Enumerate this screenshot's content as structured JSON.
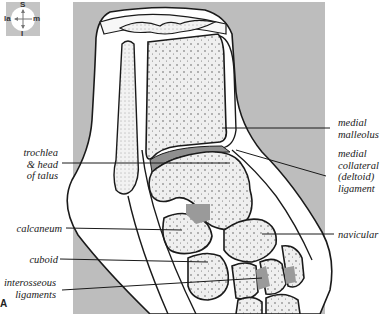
{
  "figure": {
    "figure_mark": "A",
    "colors": {
      "background_panel": "#bdbdbd",
      "bone": "#eeeeee",
      "soft_tissue": "#ffffff",
      "ligament_shading": "#9a9a9a",
      "outline": "#1a1a1a"
    }
  },
  "orientation": {
    "superior": "S",
    "inferior": "I",
    "lateral": "la",
    "medial": "m"
  },
  "labels": {
    "left": [
      {
        "id": "trochlea",
        "lines": [
          "trochlea",
          "& head",
          "of talus"
        ]
      },
      {
        "id": "calcaneum",
        "lines": [
          "calcaneum"
        ]
      },
      {
        "id": "cuboid",
        "lines": [
          "cuboid"
        ]
      },
      {
        "id": "interosseous",
        "lines": [
          "interosseous",
          "ligaments"
        ]
      }
    ],
    "right": [
      {
        "id": "medial-malleolus",
        "lines": [
          "medial",
          "malleolus"
        ]
      },
      {
        "id": "deltoid",
        "lines": [
          "medial",
          "collateral",
          "(deltoid)",
          "ligament"
        ]
      },
      {
        "id": "navicular",
        "lines": [
          "navicular"
        ]
      }
    ]
  }
}
